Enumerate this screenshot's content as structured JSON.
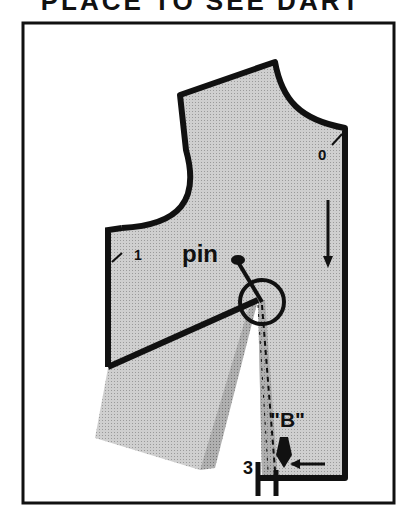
{
  "heading": "PLACE TO SEE DART",
  "labels": {
    "point_0": "0",
    "point_1": "1",
    "point_3": "3",
    "pin": "pin",
    "dart_b": "\"B\""
  },
  "colors": {
    "ink": "#111111",
    "fabric": "#c8c8c8",
    "fabric_dark": "#a9a9a9",
    "background": "#ffffff"
  }
}
